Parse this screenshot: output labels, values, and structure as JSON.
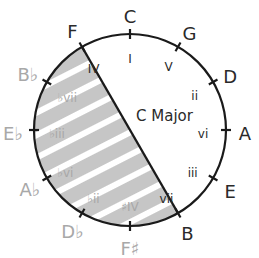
{
  "diagram": {
    "title": "C Major",
    "center": [
      130,
      130
    ],
    "radius": 96,
    "colors": {
      "circle": "#1a1a1a",
      "in_key_text": "#2a2a2a",
      "out_key_text": "#a8a8a8",
      "hatch_gray": "#c6c6c6",
      "background": "#ffffff"
    },
    "notes": [
      {
        "note": "C",
        "angle": 0,
        "degree": "I",
        "in_key": true
      },
      {
        "note": "G",
        "angle": 30,
        "degree": "V",
        "in_key": true
      },
      {
        "note": "D",
        "angle": 60,
        "degree": "ii",
        "in_key": true
      },
      {
        "note": "A",
        "angle": 90,
        "degree": "vi",
        "in_key": true
      },
      {
        "note": "E",
        "angle": 120,
        "degree": "iii",
        "in_key": true
      },
      {
        "note": "B",
        "angle": 150,
        "degree": "vii",
        "in_key": true
      },
      {
        "note": "F♯",
        "angle": 180,
        "degree": "♯IV",
        "in_key": false
      },
      {
        "note": "D♭",
        "angle": 210,
        "degree": "♭ii",
        "in_key": false
      },
      {
        "note": "A♭",
        "angle": 240,
        "degree": "♭vi",
        "in_key": false
      },
      {
        "note": "E♭",
        "angle": 270,
        "degree": "♭iii",
        "in_key": false
      },
      {
        "note": "B♭",
        "angle": 300,
        "degree": "♭vii",
        "in_key": false
      },
      {
        "note": "F",
        "angle": 330,
        "degree": "IV",
        "in_key": true
      }
    ],
    "chord": {
      "from": "F",
      "to": "B"
    },
    "hatched_region": "out-of-key side (F → B♭ → E♭ → A♭ → D♭ → F♯ → B)"
  }
}
